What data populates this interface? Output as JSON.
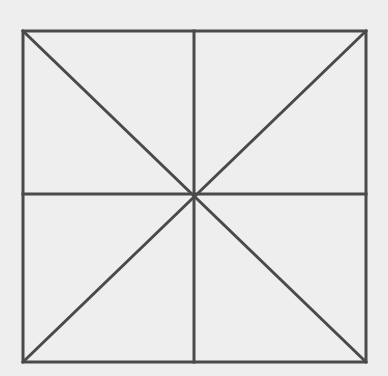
{
  "diagram": {
    "type": "square-with-diagonals-and-midlines",
    "background": "#eeeeee",
    "stroke": "#4a4a4a",
    "stroke_width": 3,
    "square": {
      "x1": 23,
      "y1": 31,
      "x2": 366,
      "y2": 362
    },
    "center": {
      "x": 194,
      "y": 194
    },
    "lines": [
      {
        "name": "diagonal-tl-br",
        "x1": 23,
        "y1": 31,
        "x2": 366,
        "y2": 362
      },
      {
        "name": "diagonal-tr-bl",
        "x1": 366,
        "y1": 31,
        "x2": 23,
        "y2": 362
      },
      {
        "name": "vertical-midline",
        "x1": 194,
        "y1": 31,
        "x2": 194,
        "y2": 362
      },
      {
        "name": "horizontal-midline",
        "x1": 23,
        "y1": 194,
        "x2": 366,
        "y2": 194
      }
    ]
  }
}
